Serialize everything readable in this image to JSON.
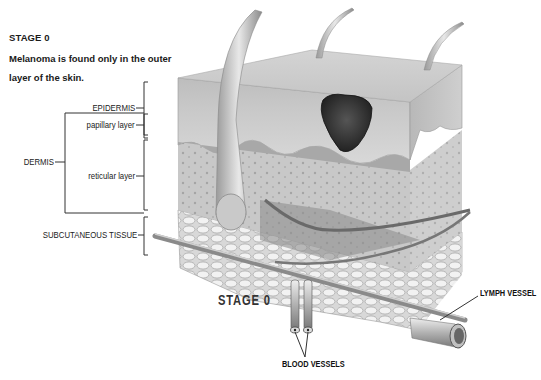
{
  "heading": {
    "title": "STAGE 0",
    "description": "Melanoma is found only in the outer layer of the skin."
  },
  "labels": {
    "epidermis": "EPIDERMIS",
    "papillary_layer": "papillary layer",
    "dermis": "DERMIS",
    "reticular_layer": "reticular layer",
    "subcutaneous_tissue": "SUBCUTANEOUS TISSUE",
    "stage_caption": "STAGE 0",
    "lymph_vessel": "LYMPH VESSEL",
    "blood_vessels": "BLOOD VESSELS"
  },
  "colors": {
    "tumor": "#2b2b2b",
    "epidermis": "#c9c9c9",
    "dermis": "#b5b5b5",
    "fat": "#e6e6e6"
  }
}
